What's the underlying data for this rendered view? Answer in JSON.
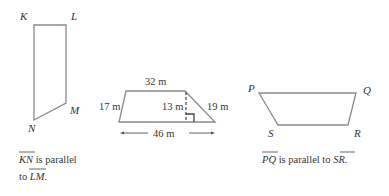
{
  "figure1": {
    "vertices": {
      "K": "K",
      "L": "L",
      "M": "M",
      "N": "N"
    },
    "caption_line1_seg": "KN",
    "caption_line1_rest": " is parallel",
    "caption_line2_pre": "to ",
    "caption_line2_seg": "LM",
    "caption_line2_post": "."
  },
  "figure2": {
    "top": "32 m",
    "left": "17 m",
    "height": "13 m",
    "right": "19 m",
    "bottom": "46 m"
  },
  "figure3": {
    "vertices": {
      "P": "P",
      "Q": "Q",
      "R": "R",
      "S": "S"
    },
    "caption_seg1": "PQ",
    "caption_mid": " is parallel to ",
    "caption_seg2": "SR",
    "caption_post": "."
  },
  "colors": {
    "outline": "#8a8a8a",
    "text": "#333333"
  }
}
